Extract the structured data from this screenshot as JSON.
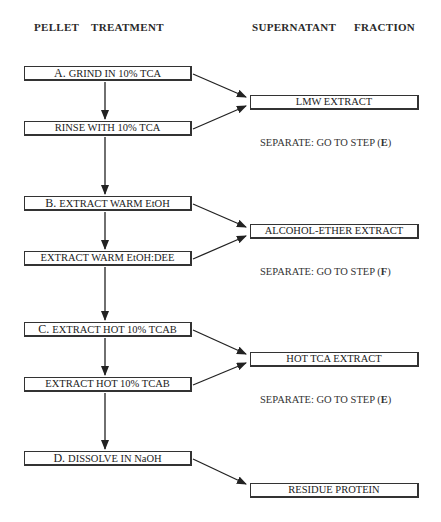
{
  "headers": {
    "left_1": "PELLET",
    "left_2": "TREATMENT",
    "right_1": "SUPERNATANT",
    "right_2": "FRACTION"
  },
  "pellet_steps": [
    {
      "step": "A.",
      "label": "GRIND IN 10% TCA"
    },
    {
      "step": "",
      "label": "RINSE WITH 10% TCA"
    },
    {
      "step": "B.",
      "label": "EXTRACT WARM EtOH"
    },
    {
      "step": "",
      "label": "EXTRACT WARM EtOH:DEE"
    },
    {
      "step": "C.",
      "label": "EXTRACT HOT 10% TCAB"
    },
    {
      "step": "",
      "label": "EXTRACT HOT 10% TCAB"
    },
    {
      "step": "D.",
      "label": "DISSOLVE IN NaOH"
    }
  ],
  "supernatant_fractions": [
    {
      "label": "LMW EXTRACT",
      "note_prefix": "SEPARATE:  GO TO STEP (",
      "note_step": "E",
      "note_suffix": ")"
    },
    {
      "label": "ALCOHOL-ETHER EXTRACT",
      "note_prefix": "SEPARATE:  GO TO STEP (",
      "note_step": "F",
      "note_suffix": ")"
    },
    {
      "label": "HOT TCA EXTRACT",
      "note_prefix": "SEPARATE: GO TO STEP (",
      "note_step": "E",
      "note_suffix": ")"
    },
    {
      "label": "RESIDUE PROTEIN"
    }
  ]
}
